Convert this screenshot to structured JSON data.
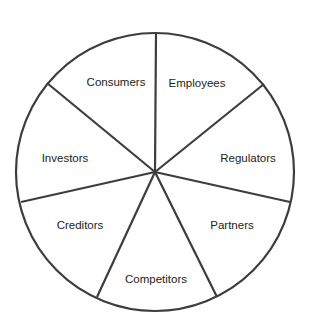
{
  "diagram": {
    "type": "stakeholder-wheel",
    "center": [
      155,
      172
    ],
    "radius": 139,
    "line_color": "#3d3d3d",
    "text_color": "#222222",
    "spoke_ends": [
      [
        156,
        33
      ],
      [
        264,
        84
      ],
      [
        290,
        202
      ],
      [
        217,
        297
      ],
      [
        97,
        297
      ],
      [
        21,
        202
      ],
      [
        47,
        83
      ]
    ],
    "segments": [
      {
        "label": "Employees",
        "x": 197,
        "y": 83
      },
      {
        "label": "Regulators",
        "x": 248,
        "y": 158
      },
      {
        "label": "Partners",
        "x": 232,
        "y": 225
      },
      {
        "label": "Competitors",
        "x": 156,
        "y": 279
      },
      {
        "label": "Creditors",
        "x": 80,
        "y": 225
      },
      {
        "label": "Investors",
        "x": 65,
        "y": 158
      },
      {
        "label": "Consumers",
        "x": 116,
        "y": 82
      }
    ]
  }
}
